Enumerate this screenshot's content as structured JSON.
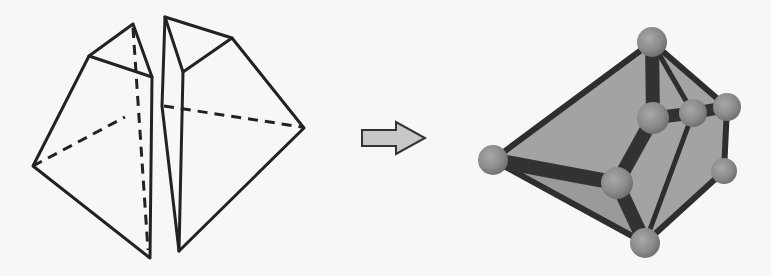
{
  "figure": {
    "left_panel": {
      "type": "line-drawing",
      "pieces": [
        {
          "name": "left-half",
          "vertices": {
            "top": [
              133,
              24
            ],
            "upper_left": [
              89,
              56
            ],
            "upper_right": [
              152,
              77
            ],
            "left": [
              33,
              166
            ],
            "bottom": [
              150,
              258
            ],
            "hidden": [
              125,
              117
            ]
          },
          "solid_edges": [
            [
              "top",
              "upper_left"
            ],
            [
              "top",
              "upper_right"
            ],
            [
              "upper_left",
              "upper_right"
            ],
            [
              "upper_left",
              "left"
            ],
            [
              "left",
              "bottom"
            ],
            [
              "upper_right",
              "bottom"
            ]
          ],
          "dashed_edges": [
            [
              "left",
              "hidden"
            ],
            [
              "top",
              "bottom"
            ]
          ]
        },
        {
          "name": "right-half",
          "vertices": {
            "top": [
              165,
              17
            ],
            "upper_right": [
              232,
              38
            ],
            "inner": [
              183,
              72
            ],
            "right": [
              304,
              128
            ],
            "bottom": [
              179,
              251
            ],
            "mid_left": [
              162,
              106
            ]
          },
          "solid_edges": [
            [
              "top",
              "upper_right"
            ],
            [
              "top",
              "inner"
            ],
            [
              "inner",
              "upper_right"
            ],
            [
              "upper_right",
              "right"
            ],
            [
              "right",
              "bottom"
            ],
            [
              "inner",
              "bottom"
            ],
            [
              "top",
              "mid_left"
            ],
            [
              "mid_left",
              "bottom"
            ]
          ],
          "dashed_edges": [
            [
              "mid_left",
              "right"
            ]
          ]
        }
      ]
    },
    "arrow": {
      "direction": "right",
      "fill": "#c8c8c8",
      "stroke": "#333333"
    },
    "right_panel": {
      "type": "ball-and-stick-model",
      "face_color": "#a3a3a3",
      "ball_color": "#8a8a8a",
      "rod_color": "#333333",
      "balls": [
        {
          "id": "top",
          "x": 652,
          "y": 42,
          "r": 15
        },
        {
          "id": "left",
          "x": 493,
          "y": 160,
          "r": 15
        },
        {
          "id": "mid_center",
          "x": 653,
          "y": 118,
          "r": 16
        },
        {
          "id": "mid_inner",
          "x": 693,
          "y": 113,
          "r": 14
        },
        {
          "id": "right_top",
          "x": 727,
          "y": 107,
          "r": 14
        },
        {
          "id": "right_low",
          "x": 724,
          "y": 171,
          "r": 13
        },
        {
          "id": "center_low",
          "x": 617,
          "y": 183,
          "r": 16
        },
        {
          "id": "bottom",
          "x": 645,
          "y": 243,
          "r": 15
        }
      ]
    }
  }
}
